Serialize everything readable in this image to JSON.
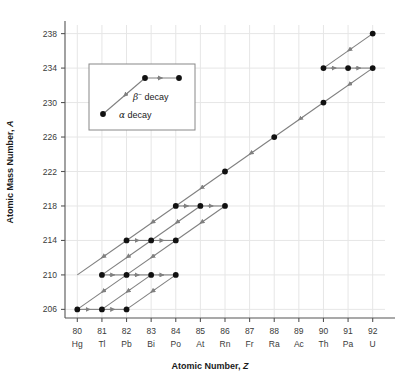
{
  "chart_data": {
    "type": "scatter",
    "title": "",
    "xlabel": "Atomic Number, Z",
    "ylabel": "Atomic Mass Number, A",
    "xlim": [
      79.5,
      92.5
    ],
    "ylim": [
      205,
      239
    ],
    "grid": true,
    "xticks": [
      80,
      81,
      82,
      83,
      84,
      85,
      86,
      87,
      88,
      89,
      90,
      91,
      92
    ],
    "xtick_labels": [
      "80",
      "81",
      "82",
      "83",
      "84",
      "85",
      "86",
      "87",
      "88",
      "89",
      "90",
      "91",
      "92"
    ],
    "xtick_symbols": [
      "Hg",
      "Tl",
      "Pb",
      "Bi",
      "Po",
      "At",
      "Rn",
      "Fr",
      "Ra",
      "Ac",
      "Th",
      "Pa",
      "U"
    ],
    "yticks": [
      206,
      210,
      214,
      218,
      222,
      226,
      230,
      234,
      238
    ],
    "ytick_labels": [
      "206",
      "210",
      "214",
      "218",
      "222",
      "226",
      "230",
      "234",
      "238"
    ],
    "points": [
      {
        "z": 92,
        "a": 238
      },
      {
        "z": 90,
        "a": 234
      },
      {
        "z": 91,
        "a": 234
      },
      {
        "z": 92,
        "a": 234
      },
      {
        "z": 90,
        "a": 230
      },
      {
        "z": 88,
        "a": 226
      },
      {
        "z": 86,
        "a": 222
      },
      {
        "z": 84,
        "a": 218
      },
      {
        "z": 85,
        "a": 218
      },
      {
        "z": 86,
        "a": 218
      },
      {
        "z": 82,
        "a": 214
      },
      {
        "z": 83,
        "a": 214
      },
      {
        "z": 84,
        "a": 214
      },
      {
        "z": 81,
        "a": 210
      },
      {
        "z": 82,
        "a": 210
      },
      {
        "z": 83,
        "a": 210
      },
      {
        "z": 84,
        "a": 210
      },
      {
        "z": 80,
        "a": 206
      },
      {
        "z": 81,
        "a": 206
      },
      {
        "z": 82,
        "a": 206
      }
    ],
    "transitions": [
      {
        "from": [
          92,
          238
        ],
        "to": [
          90,
          234
        ],
        "kind": "alpha"
      },
      {
        "from": [
          90,
          234
        ],
        "to": [
          91,
          234
        ],
        "kind": "beta"
      },
      {
        "from": [
          91,
          234
        ],
        "to": [
          92,
          234
        ],
        "kind": "beta"
      },
      {
        "from": [
          92,
          234
        ],
        "to": [
          90,
          230
        ],
        "kind": "alpha"
      },
      {
        "from": [
          90,
          230
        ],
        "to": [
          88,
          226
        ],
        "kind": "alpha"
      },
      {
        "from": [
          88,
          226
        ],
        "to": [
          86,
          222
        ],
        "kind": "alpha"
      },
      {
        "from": [
          86,
          222
        ],
        "to": [
          84,
          218
        ],
        "kind": "alpha"
      },
      {
        "from": [
          84,
          218
        ],
        "to": [
          85,
          218
        ],
        "kind": "beta"
      },
      {
        "from": [
          85,
          218
        ],
        "to": [
          86,
          218
        ],
        "kind": "beta"
      },
      {
        "from": [
          84,
          218
        ],
        "to": [
          82,
          214
        ],
        "kind": "alpha"
      },
      {
        "from": [
          85,
          218
        ],
        "to": [
          83,
          214
        ],
        "kind": "alpha"
      },
      {
        "from": [
          86,
          218
        ],
        "to": [
          84,
          214
        ],
        "kind": "alpha"
      },
      {
        "from": [
          82,
          214
        ],
        "to": [
          83,
          214
        ],
        "kind": "beta"
      },
      {
        "from": [
          83,
          214
        ],
        "to": [
          84,
          214
        ],
        "kind": "beta"
      },
      {
        "from": [
          83,
          214
        ],
        "to": [
          81,
          210
        ],
        "kind": "alpha"
      },
      {
        "from": [
          84,
          214
        ],
        "to": [
          82,
          210
        ],
        "kind": "alpha"
      },
      {
        "from": [
          82,
          214
        ],
        "to": [
          80,
          210
        ],
        "kind": "alpha"
      },
      {
        "from": [
          81,
          210
        ],
        "to": [
          82,
          210
        ],
        "kind": "beta"
      },
      {
        "from": [
          82,
          210
        ],
        "to": [
          83,
          210
        ],
        "kind": "beta"
      },
      {
        "from": [
          83,
          210
        ],
        "to": [
          84,
          210
        ],
        "kind": "beta"
      },
      {
        "from": [
          83,
          210
        ],
        "to": [
          81,
          206
        ],
        "kind": "alpha"
      },
      {
        "from": [
          84,
          210
        ],
        "to": [
          82,
          206
        ],
        "kind": "alpha"
      },
      {
        "from": [
          82,
          210
        ],
        "to": [
          80,
          206
        ],
        "kind": "alpha"
      },
      {
        "from": [
          80,
          206
        ],
        "to": [
          81,
          206
        ],
        "kind": "beta"
      },
      {
        "from": [
          81,
          206
        ],
        "to": [
          82,
          206
        ],
        "kind": "beta"
      }
    ],
    "legend": {
      "position": "upper-left-inset",
      "entries": [
        {
          "symbol": "beta",
          "label_prefix": "β",
          "label_sup": "−",
          "label": "decay"
        },
        {
          "symbol": "alpha",
          "label_prefix": "α",
          "label_sup": "",
          "label": "decay"
        }
      ]
    },
    "colors": {
      "point": "#111111",
      "arrow": "#808080",
      "grid": "#e6e6e6",
      "axis": "#555555",
      "text": "#2b2b2b",
      "legend_border": "#888888",
      "background": "#ffffff"
    }
  }
}
